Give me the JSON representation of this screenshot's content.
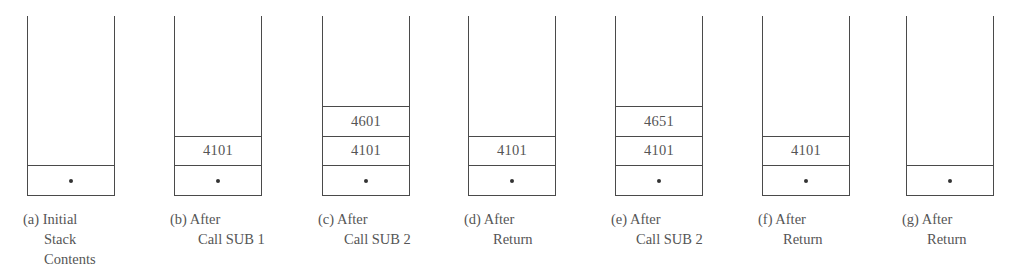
{
  "diagram": {
    "type": "stack-contents-sequence",
    "stacks": [
      {
        "id": "a",
        "left": 27,
        "caption": [
          "(a) Initial",
          "Stack",
          "Contents"
        ],
        "caption_indent": [
          0,
          21,
          21
        ],
        "cells": [
          {
            "kind": "dot",
            "value": "•"
          }
        ]
      },
      {
        "id": "b",
        "left": 174,
        "caption": [
          "(b) After",
          "Call SUB 1"
        ],
        "caption_indent": [
          0,
          28
        ],
        "cells": [
          {
            "kind": "dot",
            "value": "•"
          },
          {
            "kind": "value",
            "value": "4101"
          }
        ]
      },
      {
        "id": "c",
        "left": 322,
        "caption": [
          "(c) After",
          "Call SUB 2"
        ],
        "caption_indent": [
          0,
          26
        ],
        "cells": [
          {
            "kind": "dot",
            "value": "•"
          },
          {
            "kind": "value",
            "value": "4101"
          },
          {
            "kind": "value",
            "value": "4601"
          }
        ]
      },
      {
        "id": "d",
        "left": 468,
        "caption": [
          "(d) After",
          "Return"
        ],
        "caption_indent": [
          0,
          29
        ],
        "cells": [
          {
            "kind": "dot",
            "value": "•"
          },
          {
            "kind": "value",
            "value": "4101"
          }
        ]
      },
      {
        "id": "e",
        "left": 615,
        "caption": [
          "(e) After",
          "Call SUB 2"
        ],
        "caption_indent": [
          0,
          25
        ],
        "cells": [
          {
            "kind": "dot",
            "value": "•"
          },
          {
            "kind": "value",
            "value": "4101"
          },
          {
            "kind": "value",
            "value": "4651"
          }
        ]
      },
      {
        "id": "f",
        "left": 762,
        "caption": [
          "(f) After",
          "Return"
        ],
        "caption_indent": [
          0,
          25
        ],
        "cells": [
          {
            "kind": "dot",
            "value": "•"
          },
          {
            "kind": "value",
            "value": "4101"
          }
        ]
      },
      {
        "id": "g",
        "left": 906,
        "caption": [
          "(g) After",
          "Return"
        ],
        "caption_indent": [
          0,
          25
        ],
        "cells": [
          {
            "kind": "dot",
            "value": "•"
          }
        ]
      }
    ],
    "caption_offset": -4,
    "colors": {
      "line": "#4a4a4a",
      "text": "#555555",
      "dot": "#333333",
      "background": "#ffffff"
    }
  }
}
